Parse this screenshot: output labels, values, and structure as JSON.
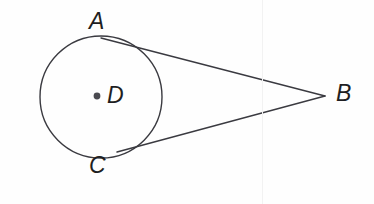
{
  "figure": {
    "kind": "geometry-diagram",
    "background_color": "#fefefe",
    "stroke_color": "#3a3a40",
    "label_color": "#1e1e22",
    "stroke_width": 1.4,
    "width": 374,
    "height": 204
  },
  "circle": {
    "name": "circle-D",
    "center_label": "D",
    "center_x": 101,
    "center_y": 97,
    "radius": 61,
    "fill": "none"
  },
  "center_dot": {
    "name": "center-point-D",
    "x": 97,
    "y": 96,
    "radius": 3.4,
    "fill": "#4a4a50"
  },
  "points": [
    {
      "id": "A",
      "label": "A",
      "x": 128,
      "y": 46,
      "role": "tangent-point-upper"
    },
    {
      "id": "C",
      "label": "C",
      "x": 130,
      "y": 147,
      "role": "tangent-point-lower"
    },
    {
      "id": "B",
      "label": "B",
      "x": 325,
      "y": 96,
      "role": "external-vertex"
    },
    {
      "id": "D",
      "label": "D",
      "x": 97,
      "y": 96,
      "role": "circle-center"
    }
  ],
  "segments": [
    {
      "id": "AB",
      "name": "tangent-segment-AB",
      "from": "A",
      "to": "B",
      "x1": 101,
      "y1": 38,
      "x2": 325,
      "y2": 96
    },
    {
      "id": "CB",
      "name": "tangent-segment-CB",
      "from": "C",
      "to": "B",
      "x1": 117,
      "y1": 152,
      "x2": 325,
      "y2": 96
    }
  ],
  "labels": {
    "A": "A",
    "B": "B",
    "C": "C",
    "D": "D"
  }
}
